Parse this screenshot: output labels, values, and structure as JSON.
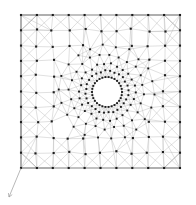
{
  "figure": {
    "kind": "finite-element-mesh",
    "title": "",
    "background_color": "#ffffff",
    "canvas": {
      "width": 196,
      "height": 205
    }
  },
  "style": {
    "edge_color": "#b9b9b9",
    "edge_color_strong": "#8f8f8f",
    "edge_width": 0.45,
    "node_color": "#1d1d1d",
    "node_marker": "square",
    "node_size": 2.1,
    "node_size_inner": 1.9,
    "arrow_color": "#9a9a9a"
  },
  "domain": {
    "name": "square-plate-with-central-hole",
    "x_min": 21,
    "x_max": 180,
    "y_min": 15,
    "y_max": 168,
    "hole": {
      "name": "central-circular-hole",
      "center_x": 107,
      "center_y": 92,
      "radius": 15,
      "boundary_node_count": 30
    }
  },
  "rings": [
    {
      "name": "hole-boundary-ring",
      "radius": 15,
      "count": 30
    },
    {
      "name": "ring-2",
      "radius": 21,
      "count": 28
    },
    {
      "name": "ring-3",
      "radius": 28,
      "count": 26
    },
    {
      "name": "ring-4",
      "radius": 37,
      "count": 24
    },
    {
      "name": "ring-5",
      "radius": 47,
      "count": 22
    }
  ],
  "grid": {
    "name": "outer-structured-grid",
    "columns": 11,
    "rows": 11,
    "spacing_x": 15.9,
    "spacing_y": 15.3
  },
  "annotations": [
    {
      "name": "corner-load-arrow",
      "type": "arrow",
      "from_x": 21,
      "from_y": 168,
      "to_x": 9,
      "to_y": 197,
      "head_size": 4
    }
  ],
  "counts": {
    "approximate_nodes": 196,
    "approximate_elements": 360
  }
}
